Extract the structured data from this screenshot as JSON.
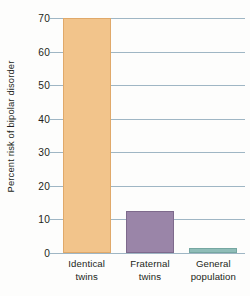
{
  "chart_data": {
    "type": "bar",
    "title": "",
    "subtitle": "",
    "xlabel": "",
    "ylabel": "Percent risk of bipolar disorder",
    "categories": [
      "Identical twins",
      "Fraternal twins",
      "General population"
    ],
    "category_lines": [
      [
        "Identical",
        "twins"
      ],
      [
        "Fraternal",
        "twins"
      ],
      [
        "General",
        "population"
      ]
    ],
    "values": [
      70,
      12.5,
      1.5
    ],
    "ylim": [
      0,
      70
    ],
    "yticks": [
      0,
      10,
      20,
      30,
      40,
      50,
      60,
      70
    ],
    "ytick_labels": [
      "0",
      "10",
      "20",
      "30",
      "40",
      "50",
      "60",
      "70"
    ],
    "grid": true,
    "grid_axis": "y",
    "legend": false,
    "legend_position": "none",
    "bar_colors": [
      "#f2c48b",
      "#9a85a8",
      "#8fbdb8"
    ],
    "grid_color": "#9fb6c4",
    "text_color": "#231f20",
    "background_color": "#fdfdfc"
  }
}
